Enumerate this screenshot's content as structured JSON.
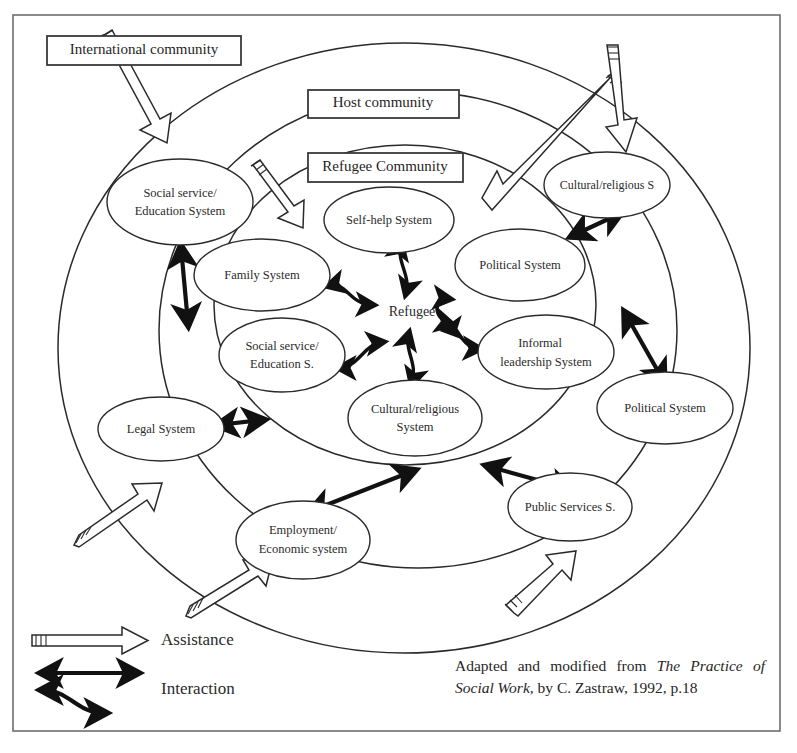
{
  "frame": {
    "label": "outer-frame"
  },
  "rings": [
    {
      "id": "international",
      "label": "International community"
    },
    {
      "id": "host",
      "label": "Host community"
    },
    {
      "id": "refugee",
      "label": "Refugee Community"
    }
  ],
  "boxes": {
    "international": "International  community",
    "host": "Host community",
    "refugee": "Refugee Community"
  },
  "center": {
    "label": "Refugee"
  },
  "nodes": {
    "intl_social_service": {
      "line1": "Social service/",
      "line2": "Education  System"
    },
    "intl_legal": {
      "line1": "Legal System",
      "line2": ""
    },
    "intl_employment": {
      "line1": "Employment/",
      "line2": "Economic system"
    },
    "host_cultural": {
      "line1": "Cultural/religious S",
      "line2": ""
    },
    "host_political": {
      "line1": "Political System",
      "line2": ""
    },
    "host_public_services": {
      "line1": "Public Services  S.",
      "line2": ""
    },
    "ref_self_help": {
      "line1": "Self-help System",
      "line2": ""
    },
    "ref_family": {
      "line1": "Family  System",
      "line2": ""
    },
    "ref_social_service": {
      "line1": "Social service/",
      "line2": "Education  S."
    },
    "ref_cultural": {
      "line1": "Cultural/religious",
      "line2": "System"
    },
    "ref_political": {
      "line1": "Political  System",
      "line2": ""
    },
    "ref_informal": {
      "line1": "Informal",
      "line2": "leadership  System"
    }
  },
  "legend": {
    "assistance": "Assistance",
    "interaction": "Interaction"
  },
  "credit": {
    "part1": "Adapted and modified from ",
    "italic1": "The Practice of Social Work,",
    "part2": " by C. Zastraw, 1992, p.18"
  },
  "colors": {
    "ink": "#2a2a2a",
    "frame": "#6e6e6e",
    "paper": "#ffffff"
  }
}
